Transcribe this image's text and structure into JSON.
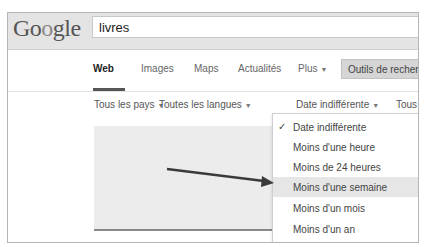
{
  "header": {
    "logo": {
      "G": "G",
      "o1": "o",
      "o2": "o",
      "rest": "gle"
    },
    "search_value": "livres"
  },
  "tabs": [
    {
      "label": "Web",
      "active": true
    },
    {
      "label": "Images"
    },
    {
      "label": "Maps"
    },
    {
      "label": "Actualités"
    },
    {
      "label": "Plus",
      "has_caret": true
    }
  ],
  "tools_button": "Outils de recherche",
  "filters": [
    {
      "label": "Tous les pays"
    },
    {
      "label": "Toutes les langues"
    },
    {
      "label": "Date indifférente"
    },
    {
      "label": "Tous"
    }
  ],
  "caret_glyph": "▼",
  "date_dropdown": {
    "items": [
      {
        "label": "Date indifférente",
        "checked": true
      },
      {
        "label": "Moins d'une heure"
      },
      {
        "label": "Moins de 24 heures"
      },
      {
        "label": "Moins d'une semaine",
        "highlighted": true
      },
      {
        "label": "Moins d'un mois"
      },
      {
        "label": "Moins d'un an"
      }
    ],
    "check_glyph": "✓"
  },
  "colors": {
    "header_bg": "#e4e4e4",
    "tools_bg": "#d5d5d5",
    "highlight_bg": "#e6e6e6",
    "arrow": "#3a3a3a"
  }
}
